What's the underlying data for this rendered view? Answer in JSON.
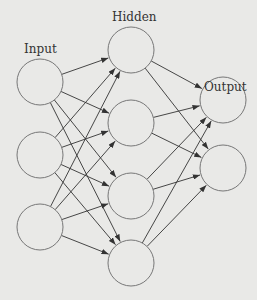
{
  "diagram": {
    "type": "neural-network",
    "labels": {
      "input": "Input",
      "hidden": "Hidden",
      "output": "Output"
    },
    "layers": {
      "input": [
        [
          40,
          82
        ],
        [
          40,
          155
        ],
        [
          40,
          227
        ]
      ],
      "hidden": [
        [
          131,
          50
        ],
        [
          131,
          123
        ],
        [
          131,
          196
        ],
        [
          131,
          263
        ]
      ],
      "output": [
        [
          223,
          100
        ],
        [
          223,
          168
        ]
      ]
    },
    "node_radius": 23,
    "colors": {
      "background": "#e9e9e7",
      "stroke": "#777777",
      "arrow": "#333333"
    }
  }
}
